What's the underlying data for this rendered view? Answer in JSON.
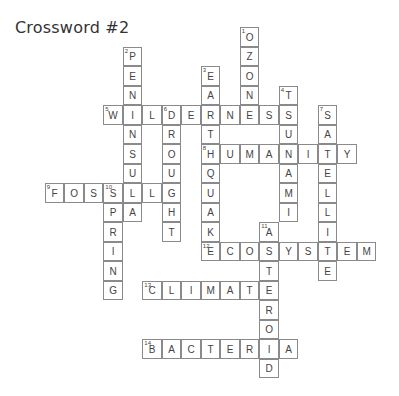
{
  "title": "Crossword #2",
  "grid": {
    "origin_x": 25.3,
    "origin_y": 27.3,
    "cell": 19.5
  },
  "words": [
    {
      "num": 1,
      "dir": "down",
      "col": 11,
      "row": 0,
      "answer": "OZONE"
    },
    {
      "num": 2,
      "dir": "down",
      "col": 5,
      "row": 1,
      "answer": "PENINSULA"
    },
    {
      "num": 3,
      "dir": "down",
      "col": 9,
      "row": 2,
      "answer": "EARTHQUAKE"
    },
    {
      "num": 4,
      "dir": "down",
      "col": 13,
      "row": 3,
      "answer": "TSUNAMI"
    },
    {
      "num": 5,
      "dir": "across",
      "col": 4,
      "row": 4,
      "answer": "WILDERNESS"
    },
    {
      "num": 6,
      "dir": "down",
      "col": 7,
      "row": 4,
      "answer": "DROUGHT"
    },
    {
      "num": 7,
      "dir": "down",
      "col": 15,
      "row": 4,
      "answer": "SATELLITE"
    },
    {
      "num": 8,
      "dir": "across",
      "col": 9,
      "row": 6,
      "answer": "HUMANITY"
    },
    {
      "num": 9,
      "dir": "across",
      "col": 1,
      "row": 8,
      "answer": "FOSSIL"
    },
    {
      "num": 10,
      "dir": "down",
      "col": 4,
      "row": 8,
      "answer": "SPRING"
    },
    {
      "num": 11,
      "dir": "down",
      "col": 12,
      "row": 10,
      "answer": "ASTEROID"
    },
    {
      "num": 12,
      "dir": "across",
      "col": 9,
      "row": 11,
      "answer": "ECOSYSTEM"
    },
    {
      "num": 13,
      "dir": "across",
      "col": 6,
      "row": 13,
      "answer": "CLIMATE"
    },
    {
      "num": 14,
      "dir": "across",
      "col": 6,
      "row": 16,
      "answer": "BACTERIA"
    }
  ]
}
